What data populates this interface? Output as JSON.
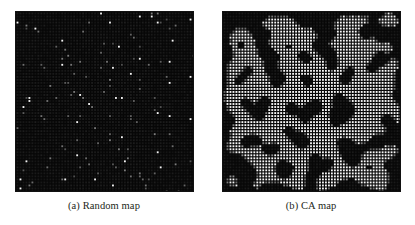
{
  "figure": {
    "background_color": "#ffffff",
    "panel_count": 2
  },
  "panels": [
    {
      "id": "random-map",
      "caption": "(a) Random map",
      "map_type": "random",
      "grid": {
        "cols": 60,
        "rows": 60,
        "cell_pitch_px": 3
      },
      "colors": {
        "background": "#070707",
        "cell_dark": "#1c1c1c",
        "cell_mid": "#3a3a3a",
        "cell_bright": "#e8e8e8",
        "grid_line": "#000000"
      },
      "fill_ratio": 0.045,
      "description": "Sparse, uniformly scattered bright cells over a dark grid"
    },
    {
      "id": "ca-map",
      "caption": "(b) CA map",
      "map_type": "cellular-automata",
      "grid": {
        "cols": 60,
        "rows": 60,
        "cell_pitch_px": 3
      },
      "colors": {
        "background": "#070707",
        "cell_dark": "#1c1c1c",
        "cell_mid": "#6e6e6e",
        "cell_bright": "#f0f0f0",
        "grid_line": "#000000"
      },
      "fill_ratio": 0.34,
      "description": "Organic clustered blobs and corridors of bright cells produced by cellular automata smoothing"
    }
  ],
  "chart_data": {
    "type": "heatmap",
    "title": "",
    "xlabel": "",
    "ylabel": "",
    "panels": [
      {
        "label": "(a) Random map",
        "rows": 60,
        "cols": 60,
        "value_range": [
          0,
          1
        ],
        "generator": "uniform-random",
        "occupied_fraction": 0.045
      },
      {
        "label": "(b) CA map",
        "rows": 60,
        "cols": 60,
        "value_range": [
          0,
          1
        ],
        "generator": "cellular-automata",
        "occupied_fraction": 0.34
      }
    ],
    "legend": [],
    "grid": true
  }
}
